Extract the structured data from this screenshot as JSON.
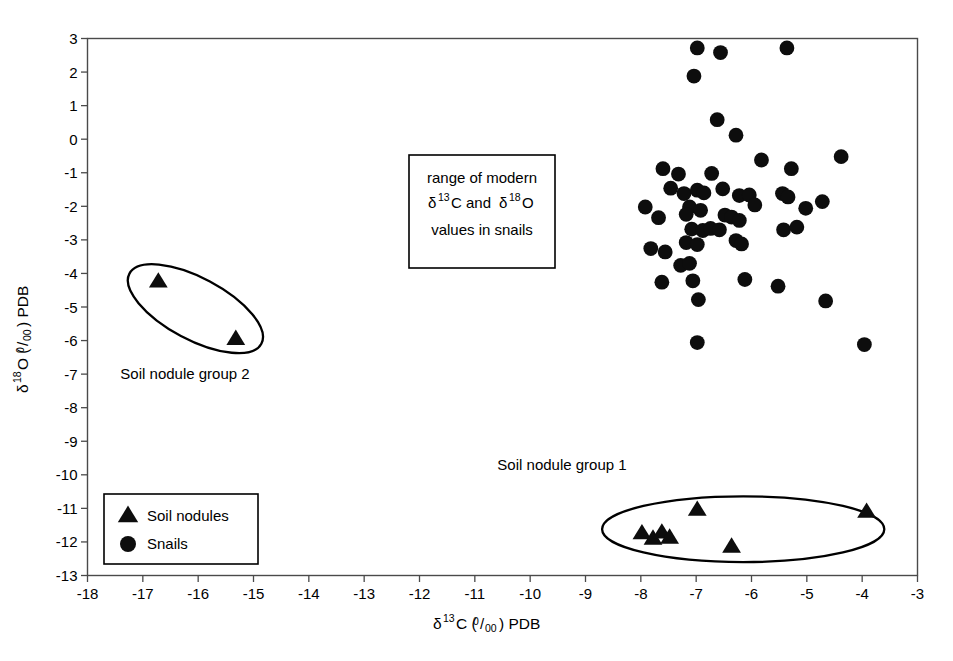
{
  "chart_data": {
    "type": "scatter",
    "title": "",
    "xlabel": "d13C (0/00) PDB",
    "ylabel": "d18O (0/00) PDB",
    "xlim": [
      -18,
      -3
    ],
    "ylim": [
      -13,
      3
    ],
    "xticks": [
      -18,
      -17,
      -16,
      -15,
      -14,
      -13,
      -12,
      -11,
      -10,
      -9,
      -8,
      -7,
      -6,
      -5,
      -4,
      -3
    ],
    "yticks": [
      3,
      2,
      1,
      0,
      -1,
      -2,
      -3,
      -4,
      -5,
      -6,
      -7,
      -8,
      -9,
      -10,
      -11,
      -12,
      -13
    ],
    "grid": false,
    "legend_position": "lower-left",
    "series": [
      {
        "name": "Soil nodules",
        "marker": "triangle",
        "color": "#0d0d0d",
        "points": [
          [
            -16.72,
            -4.22
          ],
          [
            -15.32,
            -5.93
          ],
          [
            -7.98,
            -11.72
          ],
          [
            -7.78,
            -11.88
          ],
          [
            -7.62,
            -11.7
          ],
          [
            -7.48,
            -11.85
          ],
          [
            -6.98,
            -11.02
          ],
          [
            -6.36,
            -12.12
          ],
          [
            -3.92,
            -11.08
          ]
        ]
      },
      {
        "name": "Snails",
        "marker": "circle",
        "color": "#0d0d0d",
        "points": [
          [
            -6.98,
            2.72
          ],
          [
            -6.56,
            2.58
          ],
          [
            -5.36,
            2.72
          ],
          [
            -7.04,
            1.88
          ],
          [
            -6.62,
            0.58
          ],
          [
            -6.28,
            0.12
          ],
          [
            -7.6,
            -0.88
          ],
          [
            -7.32,
            -1.04
          ],
          [
            -6.72,
            -1.02
          ],
          [
            -5.82,
            -0.62
          ],
          [
            -5.28,
            -0.88
          ],
          [
            -4.38,
            -0.52
          ],
          [
            -7.92,
            -2.02
          ],
          [
            -7.46,
            -1.46
          ],
          [
            -7.22,
            -1.62
          ],
          [
            -6.98,
            -1.52
          ],
          [
            -6.86,
            -1.6
          ],
          [
            -6.52,
            -1.48
          ],
          [
            -7.12,
            -2.02
          ],
          [
            -6.92,
            -2.12
          ],
          [
            -6.22,
            -1.68
          ],
          [
            -6.04,
            -1.66
          ],
          [
            -5.94,
            -1.96
          ],
          [
            -5.44,
            -1.62
          ],
          [
            -5.34,
            -1.72
          ],
          [
            -4.72,
            -1.86
          ],
          [
            -7.68,
            -2.34
          ],
          [
            -7.18,
            -2.24
          ],
          [
            -6.48,
            -2.26
          ],
          [
            -6.36,
            -2.32
          ],
          [
            -6.22,
            -2.42
          ],
          [
            -5.02,
            -2.06
          ],
          [
            -7.82,
            -3.26
          ],
          [
            -7.08,
            -2.68
          ],
          [
            -6.88,
            -2.72
          ],
          [
            -6.74,
            -2.66
          ],
          [
            -6.58,
            -2.7
          ],
          [
            -6.28,
            -3.02
          ],
          [
            -6.18,
            -3.12
          ],
          [
            -5.42,
            -2.7
          ],
          [
            -5.18,
            -2.62
          ],
          [
            -7.56,
            -3.36
          ],
          [
            -7.18,
            -3.08
          ],
          [
            -6.98,
            -3.14
          ],
          [
            -7.28,
            -3.76
          ],
          [
            -7.12,
            -3.7
          ],
          [
            -7.62,
            -4.26
          ],
          [
            -7.06,
            -4.22
          ],
          [
            -6.12,
            -4.18
          ],
          [
            -5.52,
            -4.38
          ],
          [
            -6.96,
            -4.78
          ],
          [
            -4.66,
            -4.82
          ],
          [
            -6.98,
            -6.06
          ],
          [
            -3.96,
            -6.12
          ]
        ]
      }
    ],
    "annotations": [
      {
        "name": "modern-range-box",
        "lines": [
          "range of modern",
          "d13C and d18O",
          "values in snails"
        ],
        "x_pct": 0.435,
        "y_pct": 0.227
      },
      {
        "name": "group1-label",
        "text": "Soil nodule group 1"
      },
      {
        "name": "group2-label",
        "text": "Soil nodule group 2"
      }
    ],
    "ellipses": [
      {
        "name": "soil-nodule-group-2-ellipse",
        "cx": -16.05,
        "cy": -5.05,
        "rx": 1.35,
        "ry": 0.92,
        "rotation": 28
      },
      {
        "name": "soil-nodule-group-1-ellipse",
        "cx": -6.15,
        "cy": -11.62,
        "rx": 2.55,
        "ry": 0.98,
        "rotation": 0
      }
    ]
  },
  "axes": {
    "x_title_main": "C (",
    "x_title_tail": ") PDB",
    "x_title_delta": "δ",
    "x_title_sup": "13",
    "y_title_main": "O (",
    "y_title_tail": ") PDB",
    "y_title_delta": "δ",
    "y_title_sup": "18",
    "permil_num": "0",
    "permil_den": "00",
    "xticks": [
      "-18",
      "-17",
      "-16",
      "-15",
      "-14",
      "-13",
      "-12",
      "-11",
      "-10",
      "-9",
      "-8",
      "-7",
      "-6",
      "-5",
      "-4",
      "-3"
    ],
    "yticks": [
      "3",
      "2",
      "1",
      "0",
      "-1",
      "-2",
      "-3",
      "-4",
      "-5",
      "-6",
      "-7",
      "-8",
      "-9",
      "-10",
      "-11",
      "-12",
      "-13"
    ]
  },
  "annotation_box": {
    "line1": "range of modern",
    "line2_a": "C and ",
    "line2_delta": "δ",
    "line2_sup1": "13",
    "line2_sup2": "18",
    "line2_b": "O",
    "line3": "values in snails"
  },
  "labels": {
    "group1": "Soil nodule group 1",
    "group2": "Soil nodule group 2"
  },
  "legend": {
    "items": [
      {
        "label": "Soil nodules",
        "marker": "triangle"
      },
      {
        "label": "Snails",
        "marker": "circle"
      }
    ]
  },
  "colors": {
    "marker": "#0d0d0d",
    "frame": "#4a4a4a",
    "outline": "#000000",
    "background": "#ffffff"
  }
}
